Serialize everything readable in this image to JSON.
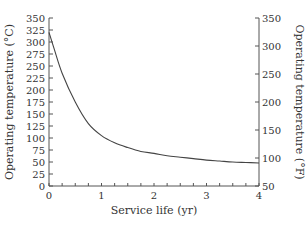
{
  "chart_data": {
    "type": "line",
    "title": "",
    "xlabel": "Service life (yr)",
    "ylabel": "Operating temperature (°C)",
    "ylabel_right": "Operating temperature (°F)",
    "xlim": [
      0,
      4
    ],
    "ylim": [
      0,
      350
    ],
    "ylim_right": [
      50,
      350
    ],
    "x_ticks": [
      "0",
      "1",
      "2",
      "3",
      "4"
    ],
    "y_ticks": [
      "0",
      "25",
      "50",
      "75",
      "100",
      "125",
      "150",
      "175",
      "200",
      "225",
      "250",
      "275",
      "300",
      "325",
      "350"
    ],
    "y_ticks_right": [
      "50",
      "100",
      "150",
      "200",
      "250",
      "300",
      "350"
    ],
    "grid": false,
    "legend": null,
    "series": [
      {
        "name": "Operating temperature",
        "x": [
          0,
          0.1,
          0.25,
          0.5,
          0.75,
          1.0,
          1.25,
          1.5,
          1.75,
          2.0,
          2.25,
          2.5,
          2.75,
          3.0,
          3.25,
          3.5,
          3.75,
          4.0
        ],
        "values": [
          320,
          285,
          235,
          175,
          130,
          105,
          90,
          80,
          72,
          68,
          63,
          60,
          57,
          54,
          52,
          50,
          49,
          48
        ]
      }
    ]
  }
}
